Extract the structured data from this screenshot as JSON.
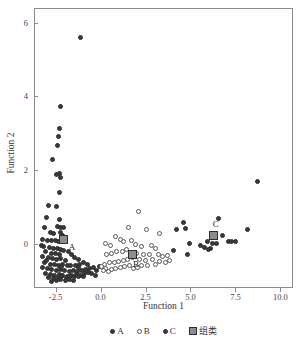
{
  "chart_data": {
    "type": "scatter",
    "title": "",
    "xlabel": "Function 1",
    "ylabel": "Function 2",
    "xlim": [
      -3.7,
      10.7
    ],
    "ylim": [
      -1.2,
      6.4
    ],
    "xticks": [
      -2.5,
      0.0,
      2.5,
      5.0,
      7.5,
      10.0
    ],
    "xticklabels": [
      "-2.5",
      "0.0",
      "2.5",
      "5.0",
      "7.5",
      "10.0"
    ],
    "yticks": [
      0,
      2,
      4,
      6
    ],
    "yticklabels": [
      "0",
      "2",
      "4",
      "6"
    ],
    "grid": false,
    "legend_position": "below-axis",
    "legend": [
      {
        "label": "A",
        "marker": "filled-circle",
        "color": "#3b3b3b"
      },
      {
        "label": "B",
        "marker": "open-circle",
        "color": "#ffffff"
      },
      {
        "label": "C",
        "marker": "filled-circle",
        "color": "#3b3b3b"
      },
      {
        "label": "组类",
        "marker": "filled-square",
        "color": "#8d8d8d"
      }
    ],
    "series": [
      {
        "name": "A",
        "marker": "filled-circle",
        "color": "#3b3b3b",
        "points": [
          [
            -1.1,
            5.6
          ],
          [
            -2.25,
            3.73
          ],
          [
            -2.3,
            3.12
          ],
          [
            -2.35,
            2.92
          ],
          [
            -2.4,
            2.68
          ],
          [
            -2.65,
            2.3
          ],
          [
            -2.3,
            1.9
          ],
          [
            -2.45,
            1.88
          ],
          [
            -2.25,
            1.8
          ],
          [
            -2.3,
            1.4
          ],
          [
            -2.9,
            1.05
          ],
          [
            -2.45,
            1.02
          ],
          [
            -3.0,
            0.72
          ],
          [
            -2.3,
            0.65
          ],
          [
            -3.1,
            0.45
          ],
          [
            -2.4,
            0.48
          ],
          [
            -2.25,
            0.45
          ],
          [
            -2.05,
            0.43
          ],
          [
            -2.8,
            0.3
          ],
          [
            -2.6,
            0.28
          ],
          [
            -2.2,
            0.3
          ],
          [
            -2.1,
            0.22
          ],
          [
            -2.0,
            0.18
          ],
          [
            -3.25,
            0.12
          ],
          [
            -2.95,
            0.1
          ],
          [
            -2.7,
            0.08
          ],
          [
            -2.5,
            0.1
          ],
          [
            -2.35,
            0.05
          ],
          [
            -2.15,
            0.05
          ],
          [
            -1.95,
            0.08
          ],
          [
            -3.3,
            -0.05
          ],
          [
            -3.15,
            -0.08
          ],
          [
            -2.85,
            -0.1
          ],
          [
            -2.6,
            -0.12
          ],
          [
            -2.4,
            -0.12
          ],
          [
            -2.2,
            -0.15
          ],
          [
            -2.05,
            -0.18
          ],
          [
            -3.05,
            -0.22
          ],
          [
            -2.75,
            -0.25
          ],
          [
            -2.5,
            -0.25
          ],
          [
            -2.3,
            -0.28
          ],
          [
            -1.8,
            -0.2
          ],
          [
            -1.6,
            -0.28
          ],
          [
            -3.2,
            -0.35
          ],
          [
            -2.9,
            -0.38
          ],
          [
            -2.65,
            -0.4
          ],
          [
            -2.45,
            -0.42
          ],
          [
            -2.2,
            -0.4
          ],
          [
            -1.95,
            -0.45
          ],
          [
            -1.45,
            -0.38
          ],
          [
            -1.2,
            -0.42
          ],
          [
            -3.1,
            -0.52
          ],
          [
            -2.8,
            -0.55
          ],
          [
            -2.55,
            -0.55
          ],
          [
            -2.35,
            -0.58
          ],
          [
            -2.1,
            -0.55
          ],
          [
            -1.85,
            -0.58
          ],
          [
            -1.65,
            -0.6
          ],
          [
            -1.4,
            -0.58
          ],
          [
            -1.15,
            -0.55
          ],
          [
            -0.95,
            -0.52
          ],
          [
            -0.7,
            -0.55
          ],
          [
            -3.25,
            -0.65
          ],
          [
            -2.95,
            -0.68
          ],
          [
            -2.7,
            -0.7
          ],
          [
            -2.45,
            -0.72
          ],
          [
            -2.25,
            -0.7
          ],
          [
            -2.0,
            -0.72
          ],
          [
            -1.75,
            -0.75
          ],
          [
            -1.5,
            -0.72
          ],
          [
            -1.3,
            -0.75
          ],
          [
            -1.05,
            -0.72
          ],
          [
            -0.85,
            -0.7
          ],
          [
            -0.6,
            -0.68
          ],
          [
            -0.4,
            -0.65
          ],
          [
            -3.05,
            -0.8
          ],
          [
            -2.8,
            -0.82
          ],
          [
            -2.55,
            -0.85
          ],
          [
            -2.3,
            -0.82
          ],
          [
            -2.1,
            -0.85
          ],
          [
            -1.85,
            -0.88
          ],
          [
            -1.6,
            -0.85
          ],
          [
            -1.35,
            -0.82
          ],
          [
            -1.1,
            -0.85
          ],
          [
            -0.9,
            -0.8
          ],
          [
            -0.65,
            -0.78
          ],
          [
            -2.9,
            -0.92
          ],
          [
            -2.6,
            -0.95
          ],
          [
            -2.35,
            -0.92
          ],
          [
            -2.15,
            -0.9
          ],
          [
            -1.9,
            -0.92
          ],
          [
            -1.7,
            -0.9
          ],
          [
            -1.45,
            -0.88
          ],
          [
            -1.2,
            -0.9
          ],
          [
            -0.95,
            -0.88
          ],
          [
            -2.45,
            -1.0
          ],
          [
            -2.2,
            -0.98
          ],
          [
            -1.95,
            -1.0
          ],
          [
            -1.7,
            -0.98
          ],
          [
            -0.5,
            -0.8
          ],
          [
            -0.3,
            -0.85
          ],
          [
            -2.7,
            -1.02
          ],
          [
            -1.5,
            -1.0
          ],
          [
            -0.2,
            -0.72
          ],
          [
            -3.0,
            -0.45
          ],
          [
            -2.15,
            -0.62
          ],
          [
            -1.25,
            -0.65
          ],
          [
            -0.05,
            -0.62
          ]
        ]
      },
      {
        "name": "B",
        "marker": "open-circle",
        "color": "#ffffff",
        "points": [
          [
            2.1,
            0.88
          ],
          [
            1.55,
            0.45
          ],
          [
            0.85,
            0.2
          ],
          [
            3.25,
            0.28
          ],
          [
            2.55,
            0.38
          ],
          [
            1.7,
            0.1
          ],
          [
            1.3,
            0.05
          ],
          [
            1.1,
            0.12
          ],
          [
            0.55,
            -0.05
          ],
          [
            0.25,
            0.02
          ],
          [
            1.95,
            -0.02
          ],
          [
            2.25,
            -0.08
          ],
          [
            2.85,
            -0.05
          ],
          [
            3.05,
            -0.12
          ],
          [
            1.45,
            -0.15
          ],
          [
            1.2,
            -0.2
          ],
          [
            0.9,
            -0.22
          ],
          [
            0.6,
            -0.25
          ],
          [
            0.35,
            -0.3
          ],
          [
            2.0,
            -0.25
          ],
          [
            2.4,
            -0.28
          ],
          [
            2.7,
            -0.3
          ],
          [
            3.2,
            -0.28
          ],
          [
            3.45,
            -0.35
          ],
          [
            3.7,
            -0.32
          ],
          [
            1.75,
            -0.38
          ],
          [
            1.5,
            -0.42
          ],
          [
            1.25,
            -0.45
          ],
          [
            1.0,
            -0.48
          ],
          [
            0.75,
            -0.5
          ],
          [
            0.5,
            -0.52
          ],
          [
            0.2,
            -0.55
          ],
          [
            2.15,
            -0.42
          ],
          [
            2.5,
            -0.45
          ],
          [
            2.9,
            -0.42
          ],
          [
            3.3,
            -0.48
          ],
          [
            3.6,
            -0.5
          ],
          [
            3.85,
            -0.45
          ],
          [
            1.6,
            -0.58
          ],
          [
            1.35,
            -0.62
          ],
          [
            1.1,
            -0.65
          ],
          [
            0.85,
            -0.68
          ],
          [
            0.6,
            -0.7
          ],
          [
            0.3,
            -0.68
          ],
          [
            0.05,
            -0.62
          ],
          [
            2.3,
            -0.6
          ],
          [
            2.05,
            -0.65
          ],
          [
            1.85,
            -0.68
          ],
          [
            0.45,
            -0.75
          ],
          [
            0.15,
            -0.72
          ],
          [
            2.6,
            -0.58
          ],
          [
            3.05,
            -0.55
          ]
        ]
      },
      {
        "name": "C",
        "marker": "filled-circle",
        "color": "#3b3b3b",
        "points": [
          [
            8.7,
            1.7
          ],
          [
            6.55,
            0.68
          ],
          [
            4.6,
            0.58
          ],
          [
            4.75,
            0.42
          ],
          [
            4.2,
            0.4
          ],
          [
            8.15,
            0.38
          ],
          [
            6.8,
            0.22
          ],
          [
            5.95,
            0.05
          ],
          [
            6.25,
            0.02
          ],
          [
            6.45,
            0.0
          ],
          [
            7.1,
            0.05
          ],
          [
            7.3,
            0.05
          ],
          [
            7.5,
            0.05
          ],
          [
            4.95,
            0.02
          ],
          [
            5.55,
            -0.05
          ],
          [
            5.8,
            -0.1
          ],
          [
            6.1,
            -0.12
          ],
          [
            4.85,
            -0.28
          ],
          [
            4.05,
            -0.18
          ],
          [
            6.0,
            -0.15
          ]
        ]
      }
    ],
    "centroids": [
      {
        "label": "A",
        "x": -2.05,
        "y": 0.12
      },
      {
        "label": "B",
        "x": 1.75,
        "y": -0.3
      },
      {
        "label": "C",
        "x": 6.3,
        "y": 0.22
      }
    ]
  }
}
